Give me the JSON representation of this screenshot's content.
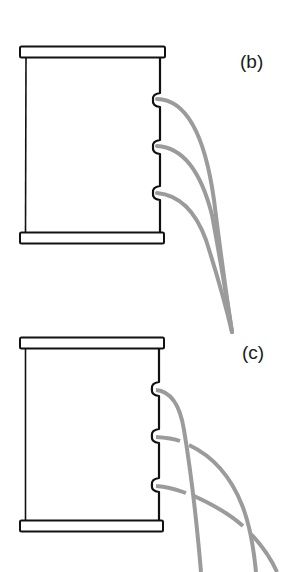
{
  "figure": {
    "panels": [
      {
        "id": "b",
        "label": "(b)",
        "description": "Container with three holes; water streams all converge to the same landing point",
        "holes": 3,
        "stream_behavior": "converge"
      },
      {
        "id": "c",
        "label": "(c)",
        "description": "Container with three holes; water streams cross and land at different points",
        "holes": 3,
        "stream_behavior": "cross"
      }
    ],
    "colors": {
      "outline": "#111111",
      "stream": "#9b9b9b",
      "background": "#ffffff"
    }
  }
}
